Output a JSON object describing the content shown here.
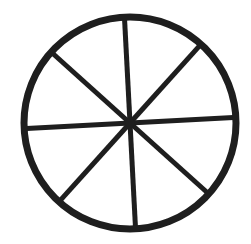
{
  "figure": {
    "colors": {
      "background": "#ffffff",
      "stroke": "#1e1e1e"
    },
    "geometry": {
      "center": [
        130,
        123
      ],
      "radius": 106,
      "rim_width": 7,
      "spoke_width": 5,
      "spoke_count": 8,
      "rotation_deg": -3
    }
  }
}
